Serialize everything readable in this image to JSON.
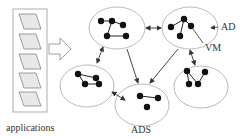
{
  "diagram": {
    "labels": {
      "applications": "applications",
      "ads": "ADS",
      "ad": "AD",
      "vm": "VM"
    },
    "colors": {
      "stroke": "#555555",
      "ellipse": "#aaaaaa",
      "node": "#111111",
      "app_fill": "#e6e6e6"
    },
    "applications_count": 5,
    "domains": [
      {
        "id": "top-left",
        "cx": 117,
        "cy": 28,
        "rx": 28,
        "ry": 21
      },
      {
        "id": "top-right",
        "cx": 190,
        "cy": 28,
        "rx": 28,
        "ry": 21
      },
      {
        "id": "mid-left",
        "cx": 87,
        "cy": 86,
        "rx": 27,
        "ry": 21
      },
      {
        "id": "mid-right",
        "cx": 201,
        "cy": 87,
        "rx": 27,
        "ry": 21
      },
      {
        "id": "bottom-center",
        "cx": 142,
        "cy": 105,
        "rx": 27,
        "ry": 21
      }
    ]
  }
}
